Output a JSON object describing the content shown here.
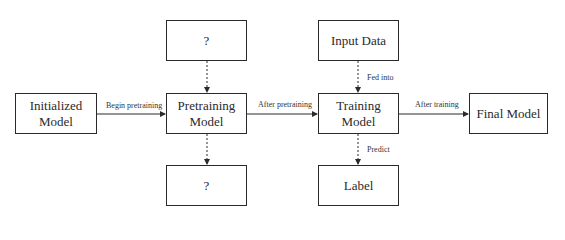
{
  "nodes": {
    "initialized": "Initialized Model",
    "pretraining": "Pretraining Model",
    "top_unknown": "?",
    "bottom_unknown": "?",
    "input_data": "Input Data",
    "training": "Training Model",
    "label": "Label",
    "final": "Final Model"
  },
  "edges": {
    "begin_pretraining": "Begin pretraining",
    "after_pretraining": "After pretraining",
    "fed_into": "Fed into",
    "predict": "Predict",
    "after_training": "After training"
  }
}
